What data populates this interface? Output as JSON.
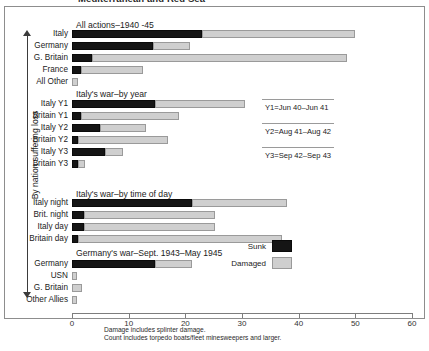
{
  "title": "Mediterranean and Red Sea",
  "axis_caption": "By nation suffering loss",
  "legend": {
    "sunk_label": "Sunk",
    "damaged_label": "Damaged",
    "sunk_color": "#151515",
    "damaged_color": "#cfcfcf"
  },
  "footnotes": [
    "Damage includes splinter damage.",
    "Count includes torpedo boats/fleet minesweepers and larger."
  ],
  "annotations": [
    "Y1=Jun 40–Jun 41",
    "Y2=Aug 41–Aug 42",
    "Y3=Sep 42–Sep 43"
  ],
  "group_titles": [
    "All actions–1940 -45",
    "Italy's war–by year",
    "Italy's war–by time of day",
    "Germany's war–Sept. 1943–May 1945"
  ],
  "chart_data": {
    "type": "bar",
    "orientation": "horizontal",
    "stacked": true,
    "title": "Mediterranean and Red Sea",
    "xlabel": "",
    "ylabel": "By nation suffering loss",
    "xlim": [
      0,
      60
    ],
    "xticks": [
      0,
      10,
      20,
      30,
      40,
      50,
      60
    ],
    "xtick_labels": [
      "0",
      "10",
      "20",
      "30",
      "40",
      "50",
      "60"
    ],
    "grid": false,
    "legend_position": "right",
    "series": [
      {
        "name": "Sunk",
        "color": "#151515"
      },
      {
        "name": "Damaged",
        "color": "#cfcfcf"
      }
    ],
    "groups": [
      {
        "title": "All actions–1940 -45",
        "categories": [
          "Italy",
          "Germany",
          "G. Britain",
          "France",
          "All Other"
        ],
        "sunk": [
          23.0,
          14.3,
          3.5,
          1.6,
          0.0
        ],
        "damaged": [
          27.0,
          6.5,
          45.0,
          10.9,
          1.1
        ]
      },
      {
        "title": "Italy's war–by year",
        "categories": [
          "Italy Y1",
          "Britain Y1",
          "Italy Y2",
          "Britain Y2",
          "Italy Y3",
          "Britain Y3"
        ],
        "sunk": [
          14.6,
          1.6,
          5.0,
          1.1,
          5.8,
          1.1
        ],
        "damaged": [
          15.9,
          17.3,
          8.0,
          15.9,
          3.2,
          1.2
        ]
      },
      {
        "title": "Italy's war–by time of day",
        "categories": [
          "Italy night",
          "Brit. night",
          "Italy day",
          "Britain day"
        ],
        "sunk": [
          21.2,
          2.2,
          2.2,
          1.1
        ],
        "damaged": [
          16.8,
          23.1,
          23.1,
          36.0
        ]
      },
      {
        "title": "Germany's war–Sept. 1943–May 1945",
        "categories": [
          "Germany",
          "USN",
          "G. Britain",
          "Other Allies"
        ],
        "sunk": [
          14.6,
          0.0,
          0.0,
          0.0
        ],
        "damaged": [
          6.5,
          0.8,
          1.8,
          0.8
        ]
      }
    ]
  }
}
